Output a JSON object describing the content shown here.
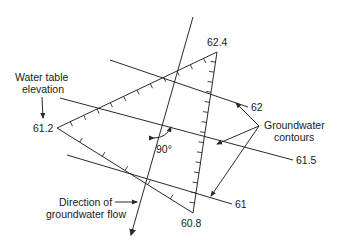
{
  "diagram": {
    "title": "",
    "vertices": [
      {
        "id": "top",
        "label": "62.4",
        "x": 217,
        "y": 52,
        "label_x": 217,
        "label_y": 46
      },
      {
        "id": "left",
        "label": "61.2",
        "x": 57,
        "y": 128,
        "label_x": 33,
        "label_y": 132
      },
      {
        "id": "bottom",
        "label": "60.8",
        "x": 193,
        "y": 213,
        "label_x": 193,
        "label_y": 226
      }
    ],
    "contours": [
      {
        "value": "62",
        "label": "62",
        "x1": 110,
        "y1": 60,
        "x2": 248,
        "y2": 107,
        "label_x": 251,
        "label_y": 111
      },
      {
        "value": "61.5",
        "label": "61.5",
        "x1": 60,
        "y1": 98,
        "x2": 293,
        "y2": 160,
        "label_x": 296,
        "label_y": 164
      },
      {
        "value": "61",
        "label": "61",
        "x1": 67,
        "y1": 155,
        "x2": 232,
        "y2": 204,
        "label_x": 235,
        "label_y": 208
      }
    ],
    "flow_line": {
      "x1": 193,
      "y1": 17,
      "x2": 131,
      "y2": 235
    },
    "angle_label": "90°",
    "labels": {
      "water_table_line1": "Water table",
      "water_table_line2": "elevation",
      "groundwater_contours_line1": "Groundwater",
      "groundwater_contours_line2": "contours",
      "flow_line1": "Direction of",
      "flow_line2": "groundwater flow"
    }
  }
}
